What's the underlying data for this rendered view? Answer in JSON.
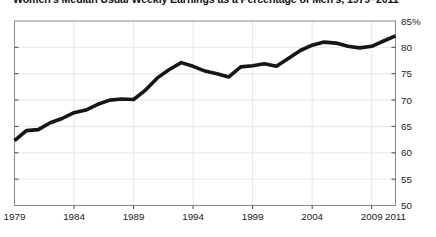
{
  "colors": {
    "line": "#161616",
    "grid": "#e7e7e7",
    "border": "#8a8a8a",
    "tick": "#4a4a4a",
    "text": "#1a1a1a",
    "background": "#ffffff"
  },
  "chart_data": {
    "type": "line",
    "title": "Women's Median Usual Weekly Earnings as a Percentage of Men's, 1979–2011",
    "xlabel": "",
    "ylabel": "",
    "xlim": [
      1979,
      2011
    ],
    "ylim": [
      50,
      85
    ],
    "grid": true,
    "legend": "none",
    "x": [
      1979,
      1980,
      1981,
      1982,
      1983,
      1984,
      1985,
      1986,
      1987,
      1988,
      1989,
      1990,
      1991,
      1992,
      1993,
      1994,
      1995,
      1996,
      1997,
      1998,
      1999,
      2000,
      2001,
      2002,
      2003,
      2004,
      2005,
      2006,
      2007,
      2008,
      2009,
      2010,
      2011
    ],
    "values": [
      62.3,
      64.2,
      64.4,
      65.7,
      66.5,
      67.6,
      68.1,
      69.2,
      70.0,
      70.2,
      70.1,
      71.9,
      74.2,
      75.8,
      77.1,
      76.4,
      75.5,
      75.0,
      74.4,
      76.3,
      76.5,
      76.9,
      76.4,
      77.9,
      79.4,
      80.4,
      81.0,
      80.8,
      80.2,
      79.9,
      80.2,
      81.2,
      82.2
    ],
    "y_ticks": [
      85,
      80,
      75,
      70,
      65,
      60,
      55,
      50
    ],
    "y_tick_labels": [
      "85%",
      "80",
      "75",
      "70",
      "65",
      "60",
      "55",
      "50"
    ],
    "y_gridlines": [
      80,
      75,
      70,
      65,
      60,
      55
    ],
    "x_tick_years": [
      1979,
      1984,
      1989,
      1994,
      1999,
      2004,
      2009,
      2011
    ],
    "x_tick_labels": [
      "1979",
      "1984",
      "1989",
      "1994",
      "1999",
      "2004",
      "2009",
      "2011"
    ],
    "x_gridline_years": [
      1984,
      1989,
      1994,
      1999,
      2004,
      2009
    ]
  }
}
